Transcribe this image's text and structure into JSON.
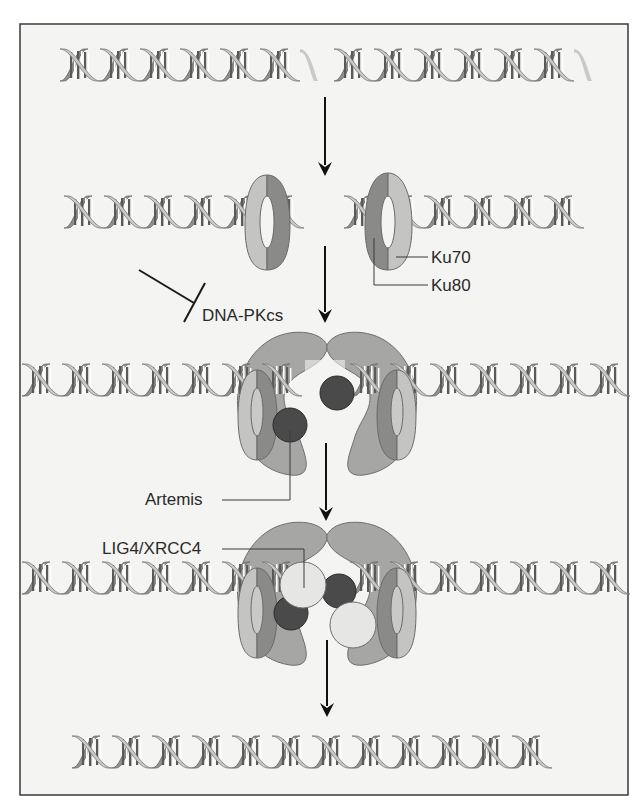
{
  "figure": {
    "colors": {
      "background": "#f4f4f2",
      "border": "#3a3a3a",
      "helix_light": "#c9c9c7",
      "helix_dark": "#8f8f8d",
      "ku_light": "#c4c4c2",
      "ku_dark": "#8a8a88",
      "dnapkcs": "#a6a6a4",
      "artemis": "#4a4a4a",
      "lig4_xrcc4": "#e6e6e4",
      "arrow": "#111111"
    },
    "labels": {
      "ku70": "Ku70",
      "ku80": "Ku80",
      "dnapkcs": "DNA-PKcs",
      "artemis": "Artemis",
      "lig4_xrcc4": "LIG4/XRCC4"
    },
    "steps": [
      {
        "name": "double-strand-break",
        "description": "Broken DNA double helix"
      },
      {
        "name": "ku-binding",
        "description": "Ku70/Ku80 heterodimer binds DNA ends"
      },
      {
        "name": "dnapkcs-artemis-recruitment",
        "description": "DNA-PKcs and Artemis recruited"
      },
      {
        "name": "ligation",
        "description": "LIG4/XRCC4 ligates ends"
      },
      {
        "name": "repaired-dna",
        "description": "Repaired continuous DNA double helix"
      }
    ]
  }
}
